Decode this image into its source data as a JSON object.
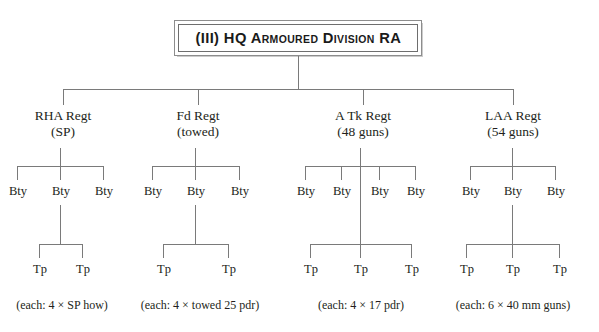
{
  "diagram": {
    "title": "(III) HQ Armoured Division RA",
    "branches": [
      {
        "name": "RHA Regt",
        "qualifier": "(SP)",
        "batteries": [
          "Bty",
          "Bty",
          "Bty"
        ],
        "troops": [
          "Tp",
          "Tp"
        ],
        "caption": "(each: 4 × SP how)"
      },
      {
        "name": "Fd Regt",
        "qualifier": "(towed)",
        "batteries": [
          "Bty",
          "Bty",
          "Bty"
        ],
        "troops": [
          "Tp",
          "Tp"
        ],
        "caption": "(each: 4 × towed 25 pdr)"
      },
      {
        "name": "A Tk Regt",
        "qualifier": "(48 guns)",
        "batteries": [
          "Bty",
          "Bty",
          "Bty",
          "Bty"
        ],
        "troops": [
          "Tp",
          "Tp",
          "Tp"
        ],
        "caption": "(each: 4 × 17 pdr)"
      },
      {
        "name": "LAA Regt",
        "qualifier": "(54 guns)",
        "batteries": [
          "Bty",
          "Bty",
          "Bty"
        ],
        "troops": [
          "Tp",
          "Tp",
          "Tp"
        ],
        "caption": "(each: 6 × 40 mm guns)"
      }
    ]
  },
  "colors": {
    "line": "#7a7a7a",
    "text": "#231f20",
    "border_outer": "#8d8d8d",
    "border_inner": "#6e6e6e",
    "background": "#ffffff"
  }
}
